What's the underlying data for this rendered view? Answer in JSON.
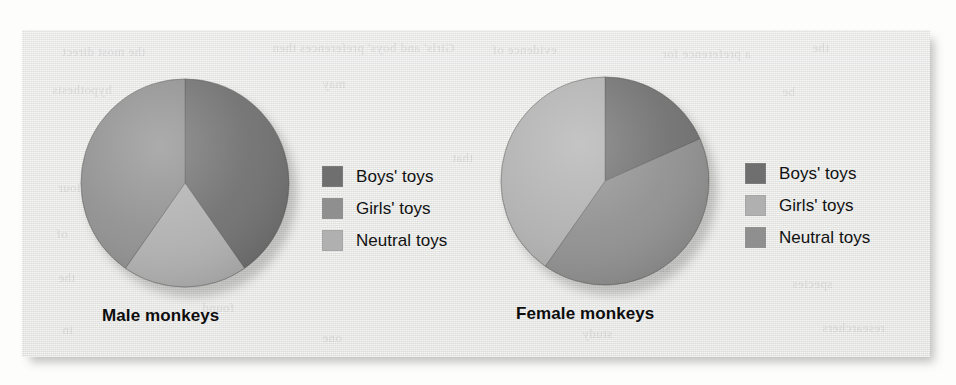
{
  "figure": {
    "background_color": "#eaeae8",
    "page_color": "#fdfdfc",
    "bleed_text": [
      "the most direct",
      "Girls' and boys' preferences then",
      "evidence of",
      "a preference for",
      "the",
      "hypothesis",
      "may",
      "indeed",
      "be",
      "behaviour",
      "of",
      "the",
      "same",
      "species",
      "in",
      "one",
      "study",
      "researchers",
      "found",
      "that"
    ]
  },
  "palette": {
    "dark": "#6f6f6f",
    "medium": "#8f8f8f",
    "light": "#b0b0b0",
    "dark_edge": "#606060",
    "medium_edge": "#7f7f7f",
    "light_edge": "#9f9f9f",
    "text": "#111111"
  },
  "chart_data": [
    {
      "type": "pie",
      "title": "Male monkeys",
      "categories": [
        "Boys' toys",
        "Girls' toys",
        "Neutral toys"
      ],
      "values": [
        40,
        40,
        20
      ],
      "units": "percent of time spent",
      "start_angle_deg": 0,
      "direction": "clockwise",
      "slice_colors": [
        "#6f6f6f",
        "#8f8f8f",
        "#b0b0b0"
      ],
      "slice_order_clockwise": [
        {
          "label": "Boys' toys",
          "value": 40,
          "start_deg": 0,
          "end_deg": 145,
          "color": "#6f6f6f"
        },
        {
          "label": "Neutral toys",
          "value": 20,
          "start_deg": 145,
          "end_deg": 215,
          "color": "#b0b0b0"
        },
        {
          "label": "Girls' toys",
          "value": 40,
          "start_deg": 215,
          "end_deg": 360,
          "color": "#8f8f8f"
        }
      ],
      "legend_position": "right",
      "legend": [
        {
          "label": "Boys' toys",
          "color": "#6f6f6f"
        },
        {
          "label": "Girls' toys",
          "color": "#8f8f8f"
        },
        {
          "label": "Neutral toys",
          "color": "#b0b0b0"
        }
      ]
    },
    {
      "type": "pie",
      "title": "Female monkeys",
      "categories": [
        "Boys' toys",
        "Girls' toys",
        "Neutral toys"
      ],
      "values": [
        18,
        40,
        42
      ],
      "units": "percent of time spent",
      "start_angle_deg": 0,
      "direction": "clockwise",
      "slice_colors": [
        "#6f6f6f",
        "#b0b0b0",
        "#8f8f8f"
      ],
      "slice_order_clockwise": [
        {
          "label": "Boys' toys",
          "value": 18,
          "start_deg": 0,
          "end_deg": 66,
          "color": "#6f6f6f"
        },
        {
          "label": "Neutral toys",
          "value": 42,
          "start_deg": 66,
          "end_deg": 215,
          "color": "#8f8f8f"
        },
        {
          "label": "Girls' toys",
          "value": 40,
          "start_deg": 215,
          "end_deg": 360,
          "color": "#b0b0b0"
        }
      ],
      "legend_position": "right",
      "legend": [
        {
          "label": "Boys' toys",
          "color": "#6f6f6f"
        },
        {
          "label": "Girls' toys",
          "color": "#b0b0b0"
        },
        {
          "label": "Neutral toys",
          "color": "#8f8f8f"
        }
      ]
    }
  ]
}
